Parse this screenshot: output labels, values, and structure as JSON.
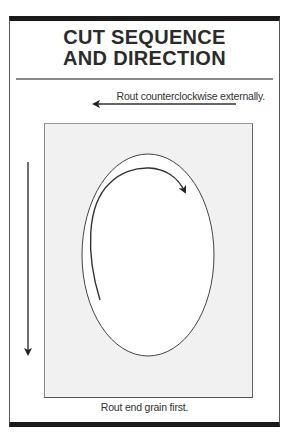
{
  "title": {
    "line1": "CUT SEQUENCE",
    "line2": "AND DIRECTION"
  },
  "labels": {
    "external": "Rout counterclockwise externally.",
    "internal_line1": "Rout clockwise",
    "internal_line2": "internally.",
    "end_grain": "Rout end grain first."
  },
  "arrows": [
    {
      "name": "external-arrow",
      "direction": "left",
      "meaning": "counterclockwise external routing"
    },
    {
      "name": "internal-arc-arrow",
      "direction": "clockwise",
      "meaning": "clockwise internal routing"
    },
    {
      "name": "end-grain-arrow",
      "direction": "down",
      "meaning": "end grain routed first"
    }
  ],
  "colors": {
    "frame_bar": "#1a1a1a",
    "divider": "#8a8a8a",
    "workpiece": "#f1f1f1",
    "text": "#333333"
  }
}
